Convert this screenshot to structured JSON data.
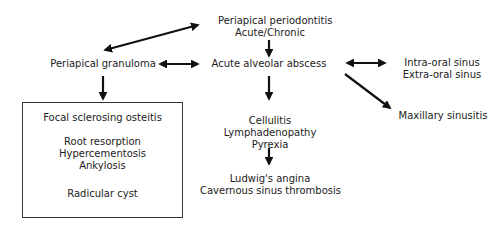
{
  "diagram": {
    "nodes": {
      "periapical_periodontitis": [
        "Periapical periodontitis",
        "Acute/Chronic"
      ],
      "periapical_granuloma": "Periapical granuloma",
      "acute_alveolar_abscess": "Acute alveolar abscess",
      "sinus": [
        "Intra-oral sinus",
        "Extra-oral sinus"
      ],
      "maxillary_sinusitis": "Maxillary sinusitis",
      "systemic": [
        "Cellulitis",
        "Lymphadenopathy",
        "Pyrexia"
      ],
      "severe": [
        "Ludwig's angina",
        "Cavernous sinus thrombosis"
      ],
      "granuloma_outcomes": {
        "group1": "Focal sclerosing osteitis",
        "group2": [
          "Root resorption",
          "Hypercementosis",
          "Ankylosis"
        ],
        "group3": "Radicular cyst"
      }
    },
    "edges": [
      {
        "from": "periapical_periodontitis",
        "to": "periapical_granuloma",
        "type": "bidirectional"
      },
      {
        "from": "periapical_periodontitis",
        "to": "acute_alveolar_abscess",
        "type": "directed"
      },
      {
        "from": "periapical_granuloma",
        "to": "acute_alveolar_abscess",
        "type": "bidirectional"
      },
      {
        "from": "acute_alveolar_abscess",
        "to": "sinus",
        "type": "bidirectional"
      },
      {
        "from": "acute_alveolar_abscess",
        "to": "maxillary_sinusitis",
        "type": "directed"
      },
      {
        "from": "acute_alveolar_abscess",
        "to": "systemic",
        "type": "directed"
      },
      {
        "from": "systemic",
        "to": "severe",
        "type": "directed"
      },
      {
        "from": "periapical_granuloma",
        "to": "granuloma_outcomes",
        "type": "directed"
      }
    ]
  }
}
